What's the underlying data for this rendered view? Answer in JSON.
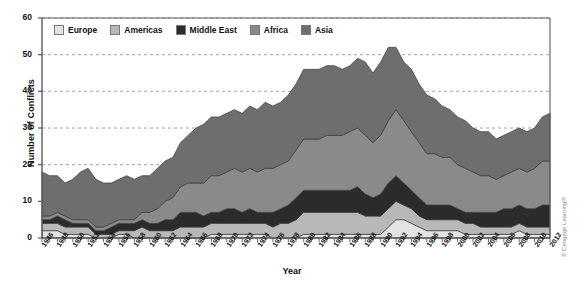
{
  "figure": {
    "credit": "© Cengage Learning®",
    "axis_color": "#5a5a5a",
    "grid_color": "#9a9a9a",
    "background": "#ffffff"
  },
  "chart_data": {
    "type": "area",
    "stacked": true,
    "title": "",
    "xlabel": "Year",
    "ylabel": "Number of Conflicts",
    "ylim": [
      0,
      60
    ],
    "yticks": [
      0,
      10,
      20,
      30,
      40,
      50,
      60
    ],
    "grid": "horizontal-dashed",
    "legend_position": "top-left-inside",
    "xlim": [
      1946,
      2012
    ],
    "x": [
      1946,
      1947,
      1948,
      1949,
      1950,
      1951,
      1952,
      1953,
      1954,
      1955,
      1956,
      1957,
      1958,
      1959,
      1960,
      1961,
      1962,
      1963,
      1964,
      1965,
      1966,
      1967,
      1968,
      1969,
      1970,
      1971,
      1972,
      1973,
      1974,
      1975,
      1976,
      1977,
      1978,
      1979,
      1980,
      1981,
      1982,
      1983,
      1984,
      1985,
      1986,
      1987,
      1988,
      1989,
      1990,
      1991,
      1992,
      1993,
      1994,
      1995,
      1996,
      1997,
      1998,
      1999,
      2000,
      2001,
      2002,
      2003,
      2004,
      2005,
      2006,
      2007,
      2008,
      2009,
      2010,
      2011,
      2012
    ],
    "xtick_labels": [
      "1946",
      "1948",
      "1950",
      "1952",
      "1954",
      "1956",
      "1958",
      "1960",
      "1962",
      "1964",
      "1966",
      "1968",
      "1970",
      "1972",
      "1974",
      "1976",
      "1978",
      "1980",
      "1982",
      "1984",
      "1986",
      "1988",
      "1990",
      "1992",
      "1994",
      "1996",
      "1998",
      "2000",
      "2002",
      "2004",
      "2006",
      "2008",
      "2010",
      "2012"
    ],
    "series": [
      {
        "name": "Europe",
        "color": "#e3e3e3",
        "values": [
          2,
          2,
          2,
          1,
          1,
          1,
          1,
          0,
          0,
          0,
          1,
          1,
          0,
          0,
          0,
          0,
          0,
          0,
          0,
          0,
          0,
          0,
          1,
          1,
          1,
          1,
          1,
          1,
          1,
          1,
          0,
          0,
          0,
          0,
          1,
          1,
          1,
          1,
          1,
          1,
          1,
          1,
          1,
          1,
          1,
          3,
          5,
          5,
          4,
          3,
          2,
          2,
          2,
          2,
          2,
          1,
          1,
          1,
          1,
          1,
          1,
          1,
          2,
          1,
          1,
          1,
          1
        ]
      },
      {
        "name": "Americas",
        "color": "#b8b8b8",
        "values": [
          2,
          2,
          2,
          2,
          2,
          2,
          2,
          1,
          1,
          1,
          1,
          1,
          2,
          3,
          2,
          2,
          2,
          2,
          3,
          3,
          3,
          3,
          3,
          3,
          3,
          3,
          3,
          3,
          3,
          3,
          3,
          4,
          4,
          5,
          6,
          6,
          6,
          6,
          6,
          6,
          6,
          6,
          5,
          5,
          5,
          5,
          5,
          4,
          4,
          3,
          3,
          3,
          3,
          3,
          3,
          3,
          3,
          2,
          2,
          2,
          2,
          2,
          2,
          2,
          2,
          2,
          2
        ]
      },
      {
        "name": "Middle East",
        "color": "#2b2b2b",
        "values": [
          1,
          1,
          2,
          2,
          1,
          1,
          1,
          1,
          1,
          2,
          2,
          2,
          2,
          2,
          2,
          2,
          3,
          3,
          4,
          4,
          4,
          3,
          3,
          3,
          4,
          4,
          3,
          4,
          3,
          3,
          4,
          4,
          5,
          6,
          6,
          6,
          6,
          6,
          6,
          6,
          6,
          7,
          6,
          5,
          6,
          7,
          7,
          6,
          5,
          5,
          4,
          4,
          4,
          4,
          3,
          3,
          3,
          4,
          4,
          4,
          5,
          5,
          5,
          5,
          5,
          6,
          6
        ]
      },
      {
        "name": "Africa",
        "color": "#8a8a8a",
        "values": [
          1,
          1,
          1,
          1,
          1,
          1,
          1,
          1,
          1,
          1,
          1,
          1,
          1,
          2,
          3,
          4,
          5,
          6,
          7,
          8,
          8,
          9,
          10,
          10,
          10,
          11,
          11,
          11,
          11,
          12,
          12,
          12,
          12,
          13,
          14,
          14,
          14,
          15,
          15,
          15,
          16,
          16,
          16,
          15,
          16,
          17,
          18,
          17,
          16,
          15,
          14,
          14,
          13,
          13,
          12,
          12,
          11,
          10,
          10,
          9,
          9,
          10,
          10,
          10,
          11,
          12,
          12
        ]
      },
      {
        "name": "Asia",
        "color": "#6e6e6e",
        "values": [
          12,
          11,
          10,
          9,
          11,
          13,
          14,
          13,
          12,
          11,
          11,
          12,
          11,
          10,
          10,
          11,
          11,
          11,
          12,
          13,
          15,
          16,
          16,
          16,
          16,
          16,
          16,
          17,
          17,
          18,
          17,
          17,
          18,
          18,
          19,
          19,
          19,
          19,
          19,
          18,
          18,
          19,
          20,
          19,
          20,
          20,
          17,
          16,
          17,
          16,
          16,
          15,
          14,
          13,
          13,
          13,
          12,
          12,
          12,
          11,
          11,
          11,
          11,
          11,
          11,
          12,
          13
        ]
      }
    ]
  },
  "legend": {
    "items": [
      {
        "label": "Europe",
        "color": "#e3e3e3"
      },
      {
        "label": "Americas",
        "color": "#b8b8b8"
      },
      {
        "label": "Middle East",
        "color": "#2b2b2b"
      },
      {
        "label": "Africa",
        "color": "#8a8a8a"
      },
      {
        "label": "Asia",
        "color": "#6e6e6e"
      }
    ]
  }
}
